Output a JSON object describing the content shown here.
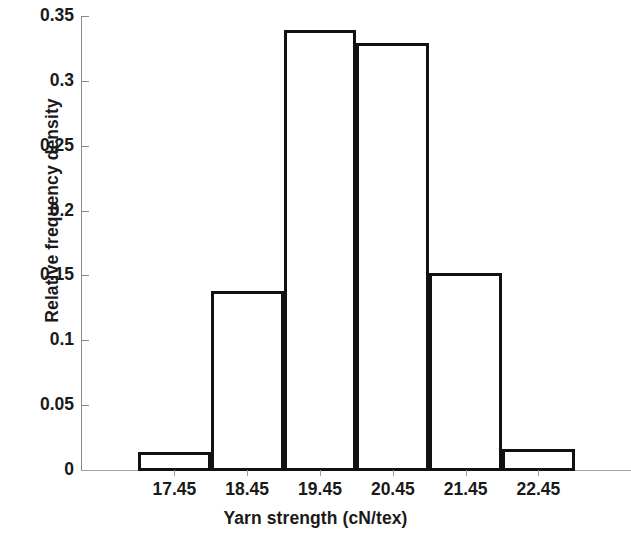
{
  "chart_data": {
    "type": "bar",
    "title": "",
    "xlabel": "Yarn strength (cN/tex)",
    "ylabel": "Relative frequency density",
    "categories": [
      "17.45",
      "18.45",
      "19.45",
      "20.45",
      "21.45",
      "22.45"
    ],
    "values": [
      0.015,
      0.139,
      0.34,
      0.33,
      0.153,
      0.017
    ],
    "ylim": [
      0,
      0.35
    ],
    "yticks": [
      "0",
      "0.05",
      "0.1",
      "0.15",
      "0.2",
      "0.25",
      "0.3",
      "0.35"
    ],
    "ytick_values": [
      0,
      0.05,
      0.1,
      0.15,
      0.2,
      0.25,
      0.3,
      0.35
    ],
    "grid": false,
    "legend": false,
    "bar_style": "outline",
    "bar_edge_color": "#111111",
    "bar_fill_color": "#ffffff",
    "axis_color": "#8a8a8a"
  },
  "axes": {
    "y_title": "Relative frequency density",
    "x_title": "Yarn strength (cN/tex)"
  }
}
